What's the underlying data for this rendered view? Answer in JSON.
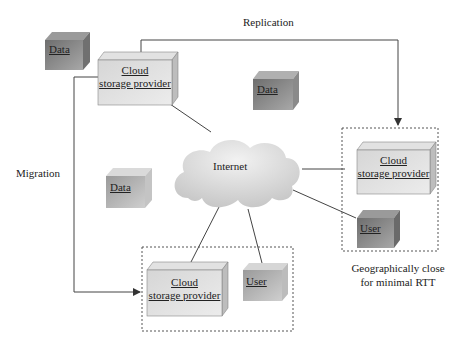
{
  "diagram": {
    "labels": {
      "replication": "Replication",
      "migration": "Migration",
      "internet": "Internet",
      "geo_note_line1": "Geographically close",
      "geo_note_line2": "for minimal RTT"
    },
    "nodes": {
      "data_top_left": "Data",
      "data_top_mid": "Data",
      "data_mid_left": "Data",
      "cloud_top": "Cloud storage provider",
      "cloud_right": "Cloud storage provider",
      "cloud_bottom": "Cloud storage provider",
      "user_right": "User",
      "user_bottom": "User"
    },
    "node_lines": {
      "cloud_l1": "Cloud",
      "cloud_l2": "storage provider"
    },
    "colors": {
      "box_light": "#dcdcdc",
      "box_dark": "#8a8a8a",
      "box_mid": "#b8b8b8",
      "line": "#444444"
    }
  }
}
